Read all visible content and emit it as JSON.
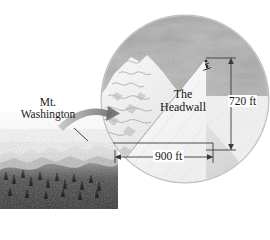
{
  "figure": {
    "kind": "textbook-diagram",
    "background_color": "#ffffff",
    "ink_color": "#1a1a1a"
  },
  "callout_label": {
    "line1": "Mt.",
    "line2": "Washington",
    "leader_icon": "leader-line-icon"
  },
  "inset": {
    "shape": "circle",
    "magnifier_arrow_icon": "curved-magnify-arrow-icon",
    "sky_color": "#9e9e9e",
    "snow_color": "#f2f2f2",
    "slope_fill": "#fbfbfb",
    "skier_icon": "skier-icon",
    "region_label": {
      "line1": "The",
      "line2": "Headwall"
    }
  },
  "dimensions": {
    "vertical": {
      "value": "720 ft",
      "orientation": "vertical",
      "arrow_icon": "double-arrow-vertical-icon"
    },
    "horizontal": {
      "value": "900 ft",
      "orientation": "horizontal",
      "arrow_icon": "double-arrow-horizontal-icon"
    }
  }
}
